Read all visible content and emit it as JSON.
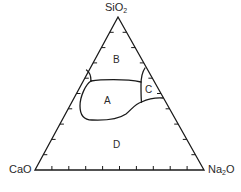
{
  "diagram": {
    "type": "ternary-phase-diagram",
    "vertices": {
      "top": {
        "formula": "SiO",
        "subscript": "2",
        "label": "SiO2"
      },
      "bottom_left": {
        "formula": "CaO",
        "subscript": "",
        "label": "CaO"
      },
      "bottom_right": {
        "formula": "Na",
        "subscript": "2",
        "suffix": "O",
        "label": "Na2O"
      }
    },
    "regions": [
      {
        "id": "A",
        "label": "A"
      },
      {
        "id": "B",
        "label": "B"
      },
      {
        "id": "C",
        "label": "C"
      },
      {
        "id": "D",
        "label": "D"
      }
    ],
    "tick_interval_percent": 10,
    "ticks_per_side": 9,
    "line_color": "#1a1a1a",
    "text_color": "#2a2a2a",
    "background": "#ffffff"
  }
}
